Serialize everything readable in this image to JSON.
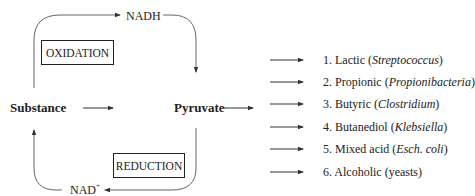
{
  "diagram": {
    "nodes": {
      "substance": "Substance",
      "pyruvate": "Pyruvate"
    },
    "cofactors": {
      "nadh": "NADH",
      "nad_base": "NAD",
      "nad_sup": "+"
    },
    "boxes": {
      "oxidation": "OXIDATION",
      "reduction": "REDUCTION"
    },
    "products": [
      {
        "num": "1.",
        "name": "Lactic",
        "organism": "Streptococcus",
        "italic": true
      },
      {
        "num": "2.",
        "name": "Propionic",
        "organism": "Propionibacteria",
        "italic": true
      },
      {
        "num": "3.",
        "name": "Butyric",
        "organism": "Clostridium",
        "italic": true
      },
      {
        "num": "4.",
        "name": "Butanediol",
        "organism": "Klebsiella",
        "italic": true
      },
      {
        "num": "5.",
        "name": "Mixed acid",
        "organism": "Esch. coli",
        "italic": true
      },
      {
        "num": "6.",
        "name": "Alcoholic",
        "organism": "yeasts",
        "italic": false
      }
    ],
    "colors": {
      "line": "#555555",
      "text": "#222222"
    }
  }
}
